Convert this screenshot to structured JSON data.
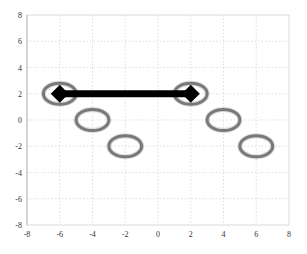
{
  "chart_data": {
    "type": "scatter",
    "title": "",
    "xlabel": "",
    "ylabel": "",
    "xlim": [
      -8,
      8
    ],
    "ylim": [
      -8,
      8
    ],
    "grid": true,
    "legend": null,
    "x_ticks": [
      -8,
      -6,
      -4,
      -2,
      0,
      2,
      4,
      6,
      8
    ],
    "y_ticks": [
      8,
      6,
      4,
      2,
      0,
      -2,
      -4,
      -6,
      -8
    ],
    "x_tick_labels": [
      "-8",
      "-6",
      "-4",
      "-2",
      "0",
      "2",
      "4",
      "6",
      "8"
    ],
    "y_tick_labels": [
      "8",
      "6",
      "4",
      "2",
      "0",
      "-2",
      "-4",
      "-6",
      "-8"
    ],
    "series": [
      {
        "name": "ellipses",
        "marker": "ellipse-outline",
        "color": "#6e6e6e",
        "points": [
          {
            "x": -6,
            "y": 2
          },
          {
            "x": -4,
            "y": 0
          },
          {
            "x": -2,
            "y": -2
          },
          {
            "x": 2,
            "y": 2
          },
          {
            "x": 4,
            "y": 0
          },
          {
            "x": 6,
            "y": -2
          }
        ],
        "rx_units": 1.0,
        "ry_units": 0.8
      }
    ],
    "annotations": [
      {
        "type": "double-arrow",
        "from": {
          "x": -6,
          "y": 2
        },
        "to": {
          "x": 2,
          "y": 2
        },
        "color": "#000000",
        "head": "diamond"
      }
    ]
  },
  "layout": {
    "plot_left": 27,
    "plot_right": 289,
    "plot_top": 15,
    "plot_bottom": 225
  }
}
